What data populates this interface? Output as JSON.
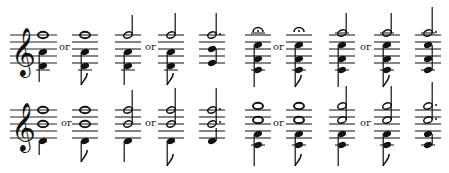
{
  "figure": {
    "connector_word": "or",
    "rows": [
      {
        "row": 1,
        "left_group": [
          "whole note over quarter",
          "or",
          "whole note over eighth",
          "half note over quarter",
          "or",
          "half note over eighth",
          "dotted half over chord"
        ],
        "right_group": [
          "whole note with fermata over chord",
          "or",
          "fermata over chord with eighth",
          "half note over chord",
          "or",
          "half note over chord with eighth",
          "dotted half over chord"
        ]
      },
      {
        "row": 2,
        "left_group": [
          "whole notes over quarter",
          "or",
          "whole notes over eighth",
          "half notes over quarter",
          "or",
          "half notes over eighth",
          "dotted halves over quarter"
        ],
        "right_group": [
          "whole notes over chord",
          "or",
          "whole notes over chord with eighth",
          "half notes over chord",
          "or",
          "half notes over chord with eighth",
          "dotted halves over chord"
        ]
      }
    ],
    "labels": {
      "or_1": "or",
      "or_2": "or",
      "or_3": "or",
      "or_4": "or",
      "or_5": "or",
      "or_6": "or",
      "or_7": "or",
      "or_8": "or"
    }
  }
}
